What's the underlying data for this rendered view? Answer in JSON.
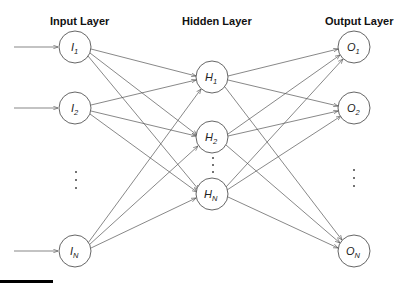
{
  "diagram": {
    "title_input": "Input Layer",
    "title_hidden": "Hidden Layer",
    "title_output": "Output  Layer",
    "input_nodes": [
      {
        "id": "I1",
        "base": "I",
        "sub": "1"
      },
      {
        "id": "I2",
        "base": "I",
        "sub": "2"
      },
      {
        "id": "IN",
        "base": "I",
        "sub": "N"
      }
    ],
    "hidden_nodes": [
      {
        "id": "H1",
        "base": "H",
        "sub": "1"
      },
      {
        "id": "H2",
        "base": "H",
        "sub": "2"
      },
      {
        "id": "HN",
        "base": "H",
        "sub": "N"
      }
    ],
    "output_nodes": [
      {
        "id": "O1",
        "base": "O",
        "sub": "1"
      },
      {
        "id": "O2",
        "base": "O",
        "sub": "2"
      },
      {
        "id": "ON",
        "base": "O",
        "sub": "N"
      }
    ],
    "ellipsis": "⋮",
    "connections": "fully connected: each input → each hidden, each hidden → each output; external arrows into each input node",
    "colors": {
      "stroke": "#555555",
      "text": "#111111",
      "background": "#ffffff"
    }
  }
}
